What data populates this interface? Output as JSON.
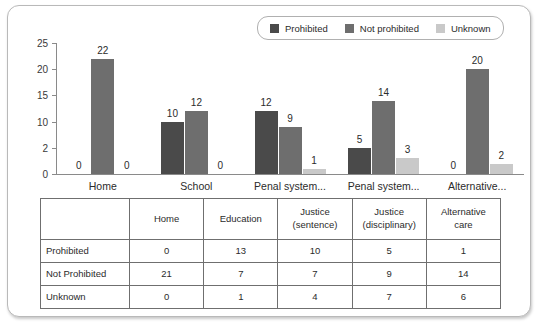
{
  "chart_data": {
    "type": "bar",
    "title": "",
    "xlabel": "",
    "ylabel": "",
    "grid": false,
    "legend_position": "top-right",
    "ylim": [
      0,
      25
    ],
    "ytick_labels": [
      "25",
      "20",
      "15",
      "10",
      "2",
      "0"
    ],
    "ytick_values": [
      25,
      20,
      15,
      10,
      5,
      0
    ],
    "categories": [
      "Home",
      "School",
      "Penal system...",
      "Penal system...",
      "Alternative..."
    ],
    "series": [
      {
        "name": "Prohibited",
        "color": "#4a4a4a",
        "values": [
          0,
          10,
          12,
          5,
          0
        ]
      },
      {
        "name": "Not prohibited",
        "color": "#6e6e6e",
        "values": [
          22,
          12,
          9,
          14,
          20
        ]
      },
      {
        "name": "Unknown",
        "color": "#c9c9c9",
        "values": [
          0,
          0,
          1,
          3,
          2
        ]
      }
    ]
  },
  "legend": {
    "items": [
      {
        "label": "Prohibited",
        "color": "#4a4a4a"
      },
      {
        "label": "Not prohibited",
        "color": "#6e6e6e"
      },
      {
        "label": "Unknown",
        "color": "#c9c9c9"
      }
    ]
  },
  "table": {
    "corner_label": "",
    "columns": [
      {
        "line1": "Home",
        "line2": ""
      },
      {
        "line1": "Education",
        "line2": ""
      },
      {
        "line1": "Justice",
        "line2": "(sentence)"
      },
      {
        "line1": "Justice",
        "line2": "(disciplinary)"
      },
      {
        "line1": "Alternative",
        "line2": "care"
      }
    ],
    "rows": [
      {
        "label": "Prohibited",
        "values": [
          "0",
          "13",
          "10",
          "5",
          "1"
        ]
      },
      {
        "label": "Not Prohibited",
        "values": [
          "21",
          "7",
          "7",
          "9",
          "14"
        ]
      },
      {
        "label": "Unknown",
        "values": [
          "0",
          "1",
          "4",
          "7",
          "6"
        ]
      }
    ]
  }
}
